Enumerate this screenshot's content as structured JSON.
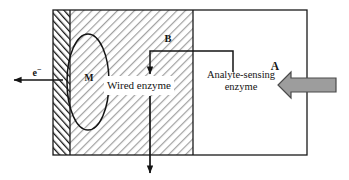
{
  "diagram": {
    "type": "schematic-cross-section",
    "regions": [
      {
        "id": "electrode",
        "name": "electrode",
        "label": "",
        "hatch": "dense-dark-forward",
        "x": 53,
        "y": 10,
        "w": 17,
        "h": 145
      },
      {
        "id": "wired-enzyme",
        "name": "wired-enzyme-layer",
        "label": "Wired enzyme",
        "hatch": "light-gray-backslash",
        "x": 70,
        "y": 10,
        "w": 123,
        "h": 145
      },
      {
        "id": "analyte-enzyme",
        "name": "analyte-sensing-layer",
        "label": "Analyte-sensing enzyme",
        "hatch": "none",
        "x": 193,
        "y": 10,
        "w": 114,
        "h": 145
      }
    ],
    "labels": {
      "wired_enzyme": "Wired enzyme",
      "analyte_sensing_enzyme": "Analyte-sensing enzyme",
      "mediator": "M",
      "electron": "e",
      "electron_charge": "−",
      "species_A": "A",
      "species_B": "B"
    },
    "arrows": [
      {
        "id": "electron-out",
        "name": "electron-arrow",
        "label": "e−",
        "direction": "left",
        "style": "thin-black",
        "from": [
          62,
          80
        ],
        "to": [
          12,
          80
        ]
      },
      {
        "id": "analyte-in",
        "name": "analyte-inflow-arrow",
        "label": "A",
        "direction": "left",
        "style": "thick-gray-block",
        "from": [
          335,
          85
        ],
        "to": [
          280,
          85
        ]
      },
      {
        "id": "mediator-b",
        "name": "species-b-arrow",
        "label": "B",
        "direction": "down",
        "style": "thin-black-elbow",
        "from": [
          233,
          70
        ],
        "to": [
          150,
          72
        ]
      },
      {
        "id": "product-out",
        "name": "product-outflow-arrow",
        "label": "",
        "direction": "down",
        "style": "thin-black",
        "from": [
          150,
          95
        ],
        "to": [
          150,
          172
        ]
      }
    ],
    "shapes": [
      {
        "id": "mediator-ellipse",
        "name": "mediator-ellipse",
        "cx": 88,
        "cy": 82,
        "rx": 21,
        "ry": 48
      }
    ],
    "colors": {
      "stroke": "#1a1a1a",
      "hatch_dark": "#141414",
      "hatch_light": "#9a9a9a",
      "arrow_gray_fill": "#9d9d9d",
      "arrow_gray_stroke": "#4a4a4a",
      "background": "#ffffff",
      "label_box_fill": "#ffffff"
    }
  }
}
